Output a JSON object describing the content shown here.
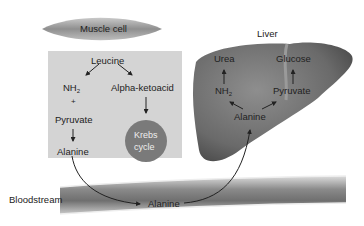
{
  "muscle": {
    "title": "Muscle cell"
  },
  "muscle_box": {
    "leucine": "Leucine",
    "nh2": "NH",
    "nh2_sub": "2",
    "plus": "+",
    "alpha_ketoacid": "Alpha-ketoacid",
    "pyruvate": "Pyruvate",
    "alanine": "Alanine",
    "krebs_line1": "Krebs",
    "krebs_line2": "cycle"
  },
  "liver": {
    "title": "Liver",
    "urea": "Urea",
    "glucose": "Glucose",
    "nh2": "NH",
    "nh2_sub": "2",
    "pyruvate": "Pyruvate",
    "alanine": "Alanine"
  },
  "bloodstream": {
    "label": "Bloodstream",
    "alanine": "Alanine"
  },
  "colors": {
    "box": "#d4d4d4",
    "krebs": "#7a7a7a",
    "liver": "#6e6e6e",
    "vessel": "#8a8a8a"
  }
}
